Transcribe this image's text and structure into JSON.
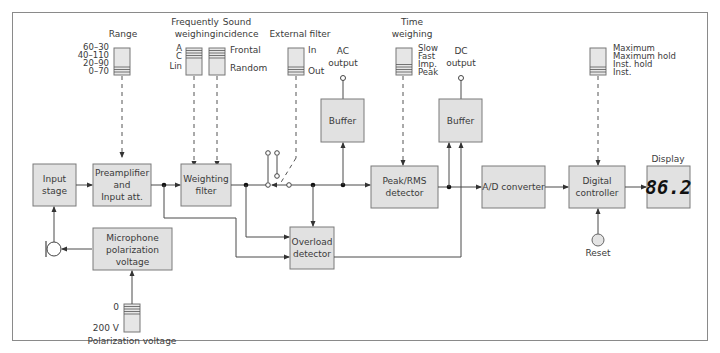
{
  "blocks": {
    "input_stage": [
      "Input",
      "stage"
    ],
    "preamp": [
      "Preamplifier",
      "and",
      "Input att."
    ],
    "weighting_filter": [
      "Weighting",
      "filter"
    ],
    "buffer_ac": "Buffer",
    "peak_rms": [
      "Peak/RMS",
      "detector"
    ],
    "buffer_dc": "Buffer",
    "ad_converter": "A/D converter",
    "digital_controller": [
      "Digital",
      "controller"
    ],
    "display_value": "86.2",
    "overload": [
      "Overload",
      "detector"
    ],
    "mic_polarization": [
      "Microphone",
      "polarization",
      "voltage"
    ]
  },
  "labels": {
    "range_title": "Range",
    "range_options": [
      "60–30",
      "40–110",
      "20–90",
      "0–70"
    ],
    "freq_weighting_title": [
      "Frequently",
      "weighing"
    ],
    "freq_weighting_options": [
      "A",
      "C",
      "Lin"
    ],
    "sound_incidence_title": [
      "Sound",
      "incidence"
    ],
    "sound_incidence_options": [
      "Frontal",
      "Random"
    ],
    "external_filter_title": "External filter",
    "external_filter_options": [
      "In",
      "Out"
    ],
    "ac_output": [
      "AC",
      "output"
    ],
    "time_weighting_title": [
      "Time",
      "weighing"
    ],
    "time_weighting_options": [
      "Slow",
      "Fast",
      "Imp.",
      "Peak"
    ],
    "dc_output": [
      "DC",
      "output"
    ],
    "hold_options": [
      "Maximum",
      "Maximum hold",
      "Inst. hold",
      "Inst."
    ],
    "display_title": "Display",
    "reset": "Reset",
    "polarization_options": [
      "0",
      "200 V"
    ],
    "polarization_title": "Polarization voltage"
  },
  "icons": {
    "microphone": "microphone-icon",
    "reset_button": "reset-button-icon",
    "slide_switch": "slide-switch-icon"
  },
  "colors": {
    "block_fill": "#e1e1e1",
    "block_stroke": "#7a7a7a",
    "line": "#4a4a4a"
  }
}
